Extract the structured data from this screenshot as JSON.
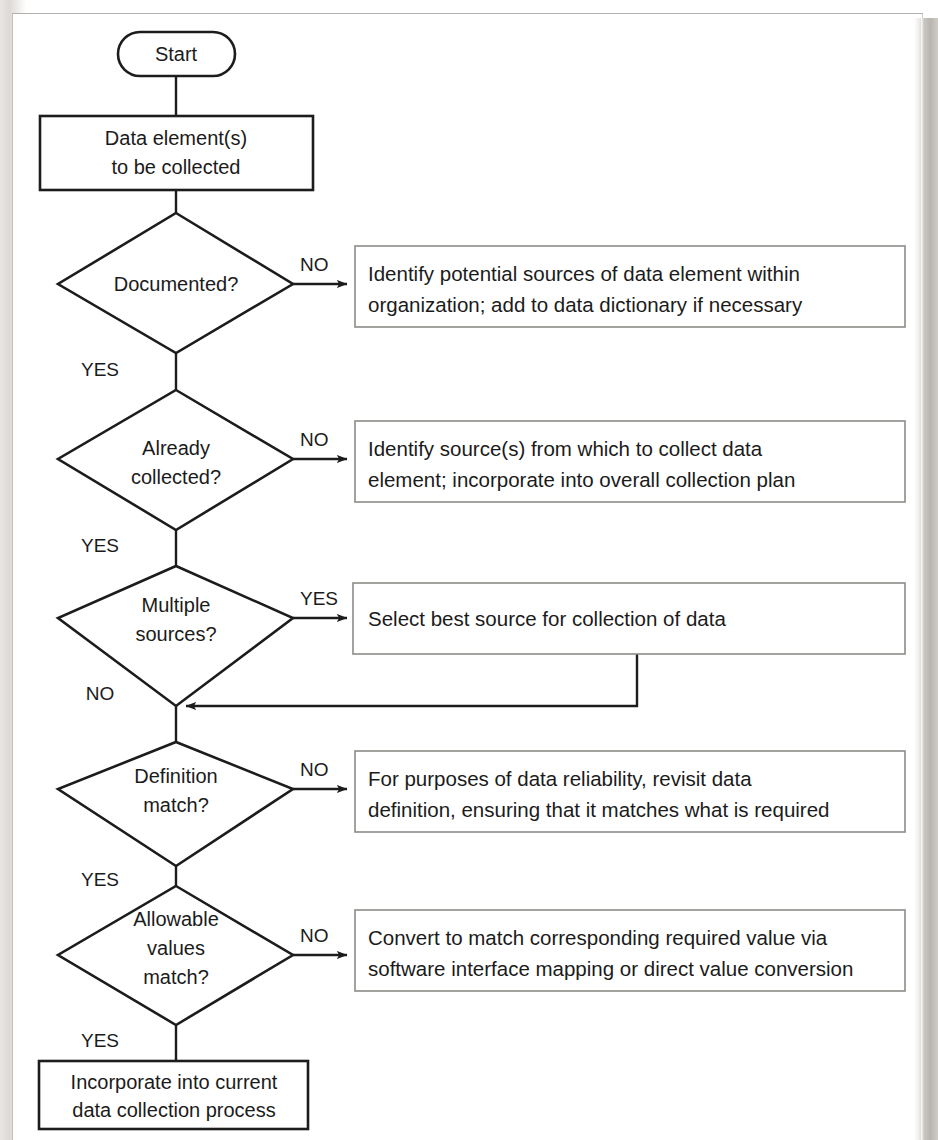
{
  "diagram": {
    "type": "flowchart",
    "colors": {
      "shape_stroke": "#1c1c1c",
      "box_stroke": "#8e8b88",
      "connector": "#1c1c1c",
      "text": "#1b1b1b",
      "page_background": "#ffffff"
    },
    "nodes": {
      "start": {
        "shape": "terminator",
        "label": "Start"
      },
      "data_element": {
        "shape": "process",
        "line1": "Data element(s)",
        "line2": "to be collected"
      },
      "documented": {
        "shape": "decision",
        "line1": "Documented?"
      },
      "already_collected": {
        "shape": "decision",
        "line1": "Already",
        "line2": "collected?"
      },
      "multiple_sources": {
        "shape": "decision",
        "line1": "Multiple",
        "line2": "sources?"
      },
      "definition_match": {
        "shape": "decision",
        "line1": "Definition",
        "line2": "match?"
      },
      "allowable_values": {
        "shape": "decision",
        "line1": "Allowable",
        "line2": "values",
        "line3": "match?"
      },
      "identify_potential": {
        "shape": "process",
        "line1": "Identify potential sources of data element within",
        "line2": "organization; add to data dictionary if necessary"
      },
      "identify_sources": {
        "shape": "process",
        "line1": "Identify source(s) from which to collect data",
        "line2": "element; incorporate into overall collection plan"
      },
      "select_best_source": {
        "shape": "process",
        "line1": "Select best source for collection of data"
      },
      "revisit_definition": {
        "shape": "process",
        "line1": "For purposes of data reliability, revisit data",
        "line2": "definition, ensuring that it matches what is required"
      },
      "convert_values": {
        "shape": "process",
        "line1": "Convert to match corresponding required value via",
        "line2": "software interface mapping or direct value conversion"
      },
      "incorporate": {
        "shape": "process",
        "line1": "Incorporate into current",
        "line2": "data collection process"
      }
    },
    "edge_labels": {
      "documented_no": "NO",
      "documented_yes": "YES",
      "already_collected_no": "NO",
      "already_collected_yes": "YES",
      "multiple_sources_yes": "YES",
      "multiple_sources_no": "NO",
      "definition_match_no": "NO",
      "definition_match_yes": "YES",
      "allowable_values_no": "NO",
      "allowable_values_yes": "YES"
    }
  }
}
